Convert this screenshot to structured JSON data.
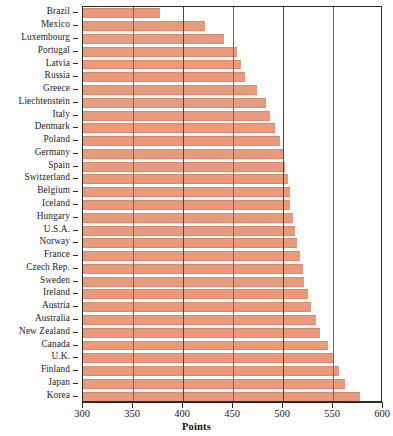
{
  "chart_data": {
    "type": "bar",
    "orientation": "horizontal",
    "title": "",
    "xlabel": "Points",
    "ylabel": "",
    "xlim": [
      300,
      600
    ],
    "xticks": [
      300,
      350,
      400,
      450,
      500,
      550,
      600
    ],
    "grid": true,
    "grid_axis": "x",
    "legend": false,
    "bar_color": "#e99a7c",
    "categories": [
      "Brazil",
      "Mexico",
      "Luxembourg",
      "Portugal",
      "Latvia",
      "Russia",
      "Greece",
      "Liechtenstein",
      "Italy",
      "Denmark",
      "Poland",
      "Germany",
      "Spain",
      "Switzerland",
      "Belgium",
      "Iceland",
      "Hungary",
      "U.S.A.",
      "Norway",
      "France",
      "Czech Rep.",
      "Sweden",
      "Ireland",
      "Austria",
      "Australia",
      "New Zealand",
      "Canada",
      "U.K.",
      "Finland",
      "Japan",
      "Korea"
    ],
    "values": [
      377,
      422,
      441,
      454,
      458,
      462,
      474,
      483,
      487,
      492,
      497,
      500,
      502,
      505,
      507,
      507,
      510,
      512,
      514,
      517,
      520,
      521,
      525,
      528,
      533,
      537,
      545,
      550,
      556,
      562,
      577
    ]
  }
}
